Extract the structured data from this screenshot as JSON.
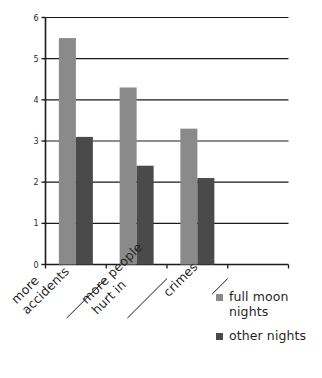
{
  "chart_data": {
    "type": "bar",
    "title": "",
    "subtitle": "",
    "xlabel": "",
    "ylabel": "",
    "categories": [
      "more accidents",
      "more people hurt in",
      "crimes"
    ],
    "category_lines": [
      [
        "more",
        "accidents"
      ],
      [
        "more people",
        "hurt in"
      ],
      [
        "crimes"
      ]
    ],
    "series": [
      {
        "name": "full moon nights",
        "values": [
          5.5,
          4.3,
          3.3
        ],
        "color": "#8a8a8a"
      },
      {
        "name": "other nights",
        "values": [
          3.1,
          2.4,
          2.1
        ],
        "color": "#4a4a4a"
      }
    ],
    "ylim": [
      0,
      6
    ],
    "yticks": [
      "0",
      "1",
      "2",
      "3",
      "4",
      "5",
      "6"
    ],
    "ytick_values": [
      0,
      1,
      2,
      3,
      4,
      5,
      6
    ],
    "grid": true,
    "grid_axis": "y",
    "legend_position": "bottom-right",
    "axis_color": "#1a1a1a",
    "background": "#ffffff"
  },
  "legend": {
    "entries": [
      {
        "label_line1": "full moon",
        "label_line2": "nights",
        "color": "#8a8a8a"
      },
      {
        "label_line1": "other nights",
        "label_line2": "",
        "color": "#4a4a4a"
      }
    ]
  }
}
